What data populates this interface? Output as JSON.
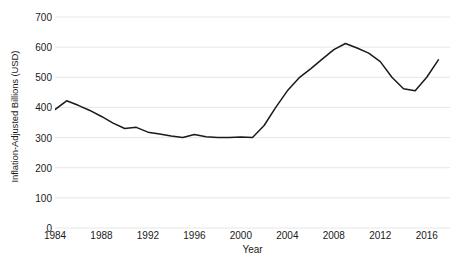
{
  "chart_data": {
    "type": "line",
    "title": "",
    "xlabel": "Year",
    "ylabel": "Inflation-Adjusted Billions (USD)",
    "xlim": [
      1984,
      2018
    ],
    "ylim": [
      0,
      700
    ],
    "xticks": [
      1984,
      1988,
      1992,
      1996,
      2000,
      2004,
      2008,
      2012,
      2016
    ],
    "yticks": [
      0,
      100,
      200,
      300,
      400,
      500,
      600,
      700
    ],
    "grid": "horizontal",
    "legend": "none",
    "line_color": "#1a1a1a",
    "grid_color": "#e6e6e6",
    "x": [
      1984,
      1985,
      1986,
      1987,
      1988,
      1989,
      1990,
      1991,
      1992,
      1993,
      1994,
      1995,
      1996,
      1997,
      1998,
      1999,
      2000,
      2001,
      2002,
      2003,
      2004,
      2005,
      2006,
      2007,
      2008,
      2009,
      2010,
      2011,
      2012,
      2013,
      2014,
      2015,
      2016,
      2017
    ],
    "values": [
      393,
      422,
      407,
      390,
      370,
      348,
      330,
      334,
      318,
      312,
      305,
      300,
      310,
      303,
      300,
      300,
      302,
      300,
      340,
      400,
      455,
      498,
      528,
      560,
      592,
      612,
      597,
      580,
      552,
      500,
      462,
      455,
      500,
      558
    ],
    "series": [
      {
        "name": "Inflation-Adjusted Billions (USD)",
        "values": [
          393,
          422,
          407,
          390,
          370,
          348,
          330,
          334,
          318,
          312,
          305,
          300,
          310,
          303,
          300,
          300,
          302,
          300,
          340,
          400,
          455,
          498,
          528,
          560,
          592,
          612,
          597,
          580,
          552,
          500,
          462,
          455,
          500,
          558
        ]
      }
    ]
  }
}
